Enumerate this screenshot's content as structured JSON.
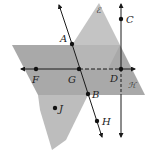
{
  "diagram": {
    "colors": {
      "background": "#ffffff",
      "plane_E": "#bdbdbd",
      "plane_H": "#a9a9a9",
      "line": "#1a1a1a",
      "point": "#111111"
    },
    "planes": [
      {
        "name": "E",
        "label": "ℰ"
      },
      {
        "name": "H",
        "label": "ℋ"
      }
    ],
    "points": [
      {
        "name": "A",
        "label": "A"
      },
      {
        "name": "B",
        "label": "B"
      },
      {
        "name": "C",
        "label": "C"
      },
      {
        "name": "D",
        "label": "D"
      },
      {
        "name": "F",
        "label": "F"
      },
      {
        "name": "G",
        "label": "G"
      },
      {
        "name": "H",
        "label": "H"
      },
      {
        "name": "J",
        "label": "J"
      }
    ],
    "lines": [
      {
        "name": "line-AB",
        "through": [
          "A",
          "G",
          "B",
          "H"
        ]
      },
      {
        "name": "line-FD",
        "through": [
          "F",
          "G",
          "D"
        ]
      },
      {
        "name": "line-CD",
        "through": [
          "C",
          "D"
        ]
      }
    ]
  }
}
